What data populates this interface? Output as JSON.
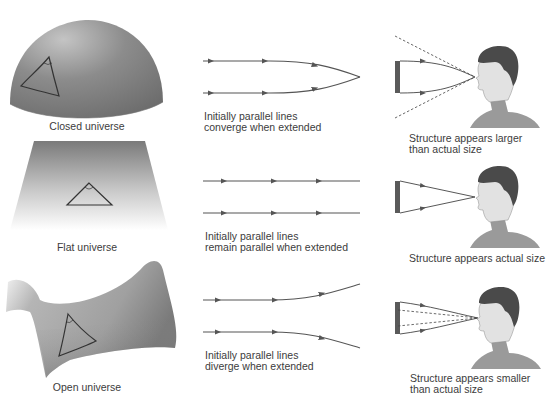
{
  "colors": {
    "surface_dark": "#6e6e6e",
    "surface_light": "#d8d8d8",
    "line": "#555555",
    "bar": "#5a5a5a",
    "skin": "#e4e4e4",
    "hair": "#4a4a4a",
    "shirt": "#9a9a9a"
  },
  "rows": [
    {
      "surface": {
        "type": "sphere",
        "label": "Closed universe"
      },
      "lines": {
        "behavior": "converge",
        "caption_line1": "Initially parallel lines",
        "caption_line2": "converge when extended"
      },
      "observer": {
        "effect": "larger",
        "caption_line1": "Structure appears larger",
        "caption_line2": "than actual size"
      }
    },
    {
      "surface": {
        "type": "plane",
        "label": "Flat universe"
      },
      "lines": {
        "behavior": "parallel",
        "caption_line1": "Initially parallel lines",
        "caption_line2": "remain parallel when extended"
      },
      "observer": {
        "effect": "actual",
        "caption_line1": "Structure appears actual size",
        "caption_line2": ""
      }
    },
    {
      "surface": {
        "type": "saddle",
        "label": "Open universe"
      },
      "lines": {
        "behavior": "diverge",
        "caption_line1": "Initially parallel lines",
        "caption_line2": "diverge when extended"
      },
      "observer": {
        "effect": "smaller",
        "caption_line1": "Structure appears smaller",
        "caption_line2": "than actual size"
      }
    }
  ]
}
